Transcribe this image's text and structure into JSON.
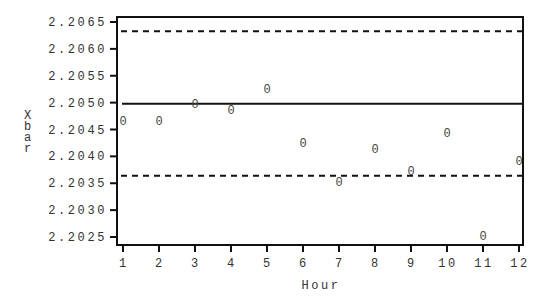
{
  "chart_data": {
    "type": "scatter",
    "title": "",
    "xlabel": "Hour",
    "ylabel": "Xbar",
    "x": [
      1,
      2,
      3,
      4,
      5,
      6,
      7,
      8,
      9,
      10,
      11,
      12
    ],
    "values": [
      2.20466,
      2.20466,
      2.20497,
      2.20486,
      2.20525,
      2.20425,
      2.20352,
      2.20414,
      2.20373,
      2.20443,
      2.20252,
      2.20392
    ],
    "marker": "0",
    "x_ticks": [
      "1",
      "2",
      "3",
      "4",
      "5",
      "6",
      "7",
      "8",
      "9",
      "10",
      "11",
      "12"
    ],
    "y_ticks": [
      "2.2025",
      "2.2030",
      "2.2035",
      "2.2040",
      "2.2045",
      "2.2050",
      "2.2055",
      "2.2060",
      "2.2065"
    ],
    "xlim": [
      1,
      12
    ],
    "ylim": [
      2.2025,
      2.2065
    ],
    "reference_lines": [
      {
        "name": "UCL",
        "value": 2.20633,
        "style": "dashed"
      },
      {
        "name": "Center",
        "value": 2.20498,
        "style": "solid"
      },
      {
        "name": "LCL",
        "value": 2.20364,
        "style": "dashed"
      }
    ],
    "grid": false,
    "legend": "none"
  }
}
